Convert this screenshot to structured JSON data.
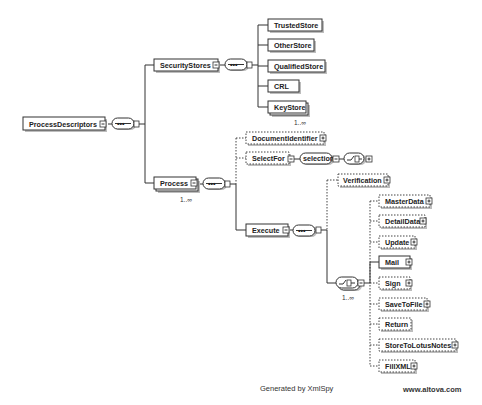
{
  "diagram": {
    "root": {
      "label": "ProcessDescriptors"
    },
    "security_stores": {
      "label": "SecurityStores",
      "children": [
        {
          "label": "TrustedStore"
        },
        {
          "label": "OtherStore"
        },
        {
          "label": "QualifiedStore"
        },
        {
          "label": "CRL"
        },
        {
          "label": "KeyStore",
          "cardinality": "1..∞"
        }
      ]
    },
    "process": {
      "label": "Process",
      "cardinality": "1..∞",
      "children": {
        "document_identifier": "DocumentIdentifier",
        "select_for": "SelectFor",
        "selection": "selection",
        "execute": "Execute"
      }
    },
    "execute": {
      "verification": "Verification",
      "choice_cardinality": "1..∞",
      "choice_children": [
        {
          "label": "MasterData",
          "optional": true
        },
        {
          "label": "DetailData",
          "optional": true
        },
        {
          "label": "Update",
          "optional": true
        },
        {
          "label": "Mail",
          "optional": false
        },
        {
          "label": "Sign",
          "optional": true
        },
        {
          "label": "SaveToFile",
          "optional": true
        },
        {
          "label": "Return",
          "optional": true
        },
        {
          "label": "StoreToLotusNotes",
          "optional": true
        },
        {
          "label": "FillXML",
          "optional": true
        }
      ]
    },
    "sequence_symbol": "•••",
    "footer": {
      "generated_by": "Generated by XmlSpy",
      "website": "www.altova.com"
    }
  }
}
